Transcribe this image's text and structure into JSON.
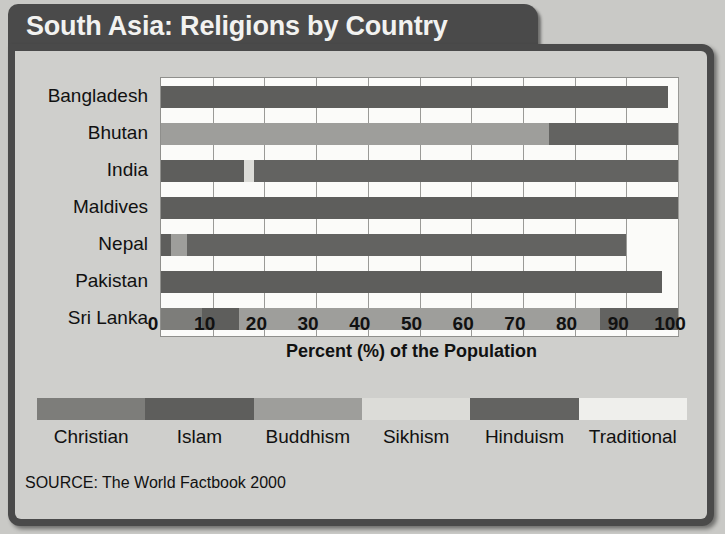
{
  "title": "South Asia: Religions by Country",
  "source": "SOURCE: The World Factbook 2000",
  "legend": {
    "items": [
      {
        "label": "Christian",
        "color": "#7d7d7a"
      },
      {
        "label": "Islam",
        "color": "#5e5e5c"
      },
      {
        "label": "Buddhism",
        "color": "#9e9e9b"
      },
      {
        "label": "Sikhism",
        "color": "#dcdcd8"
      },
      {
        "label": "Hinduism",
        "color": "#636361"
      },
      {
        "label": "Traditional",
        "color": "#efefec"
      }
    ]
  },
  "chart_data": {
    "type": "bar",
    "orientation": "horizontal",
    "stacked": true,
    "title": "South Asia: Religions by Country",
    "xlabel": "Percent (%) of the Population",
    "ylabel": "",
    "xlim": [
      0,
      100
    ],
    "xticks": [
      0,
      10,
      20,
      30,
      40,
      50,
      60,
      70,
      80,
      90,
      100
    ],
    "xtick_labels": [
      "0",
      "10",
      "20",
      "30",
      "40",
      "50",
      "60",
      "70",
      "80",
      "90",
      "100"
    ],
    "grid": true,
    "legend_position": "bottom",
    "categories": [
      "Bangladesh",
      "Bhutan",
      "India",
      "Maldives",
      "Nepal",
      "Pakistan",
      "Sri Lanka"
    ],
    "series": [
      {
        "name": "Christian",
        "values": [
          0,
          0,
          0,
          0,
          0,
          0,
          8
        ]
      },
      {
        "name": "Islam",
        "values": [
          98,
          0,
          16,
          100,
          2,
          97,
          7
        ]
      },
      {
        "name": "Buddhism",
        "values": [
          0,
          75,
          0,
          0,
          3,
          0,
          70
        ]
      },
      {
        "name": "Sikhism",
        "values": [
          0,
          0,
          2,
          0,
          0,
          0,
          0
        ]
      },
      {
        "name": "Hinduism",
        "values": [
          0,
          25,
          82,
          0,
          85,
          0,
          15
        ]
      },
      {
        "name": "Traditional",
        "values": [
          0,
          0,
          0,
          0,
          0,
          0,
          0
        ]
      }
    ],
    "bars": [
      {
        "category": "Bangladesh",
        "segments": [
          {
            "name": "Islam",
            "start": 0,
            "end": 98
          }
        ]
      },
      {
        "category": "Bhutan",
        "segments": [
          {
            "name": "Buddhism",
            "start": 0,
            "end": 75
          },
          {
            "name": "Hinduism",
            "start": 75,
            "end": 100
          }
        ]
      },
      {
        "category": "India",
        "segments": [
          {
            "name": "Islam",
            "start": 0,
            "end": 16
          },
          {
            "name": "Sikhism",
            "start": 16,
            "end": 18
          },
          {
            "name": "Hinduism",
            "start": 18,
            "end": 100
          }
        ]
      },
      {
        "category": "Maldives",
        "segments": [
          {
            "name": "Islam",
            "start": 0,
            "end": 100
          }
        ]
      },
      {
        "category": "Nepal",
        "segments": [
          {
            "name": "Islam",
            "start": 0,
            "end": 2
          },
          {
            "name": "Buddhism",
            "start": 2,
            "end": 5
          },
          {
            "name": "Hinduism",
            "start": 5,
            "end": 90
          }
        ]
      },
      {
        "category": "Pakistan",
        "segments": [
          {
            "name": "Islam",
            "start": 0,
            "end": 97
          }
        ]
      },
      {
        "category": "Sri Lanka",
        "segments": [
          {
            "name": "Christian",
            "start": 0,
            "end": 8
          },
          {
            "name": "Islam",
            "start": 8,
            "end": 15
          },
          {
            "name": "Buddhism",
            "start": 15,
            "end": 85
          },
          {
            "name": "Hinduism",
            "start": 85,
            "end": 100
          }
        ]
      }
    ]
  }
}
